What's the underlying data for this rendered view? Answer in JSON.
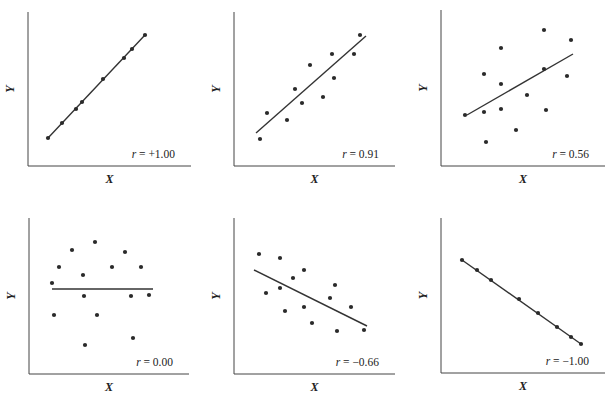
{
  "figure": {
    "panels_layout": "2 rows x 3 columns"
  },
  "chart_data": [
    {
      "type": "scatter",
      "title": "",
      "xlabel": "X",
      "ylabel": "Y",
      "annotation": "r = +1.00",
      "r_symbol": "r",
      "r_value": "= +1.00",
      "grid": false,
      "has_fit_line": true,
      "points_px": [
        [
          48,
          138
        ],
        [
          62,
          123
        ],
        [
          76,
          109
        ],
        [
          82,
          102
        ],
        [
          103,
          79
        ],
        [
          124,
          58
        ],
        [
          132,
          49
        ],
        [
          145,
          35
        ]
      ],
      "fit_px": [
        [
          48,
          138
        ],
        [
          145,
          35
        ]
      ],
      "axis_px": {
        "x0": 28,
        "y_top": 12,
        "y0": 166,
        "x_end": 191
      }
    },
    {
      "type": "scatter",
      "xlabel": "X",
      "ylabel": "Y",
      "annotation": "r = 0.91",
      "r_symbol": "r",
      "r_value": "= 0.91",
      "grid": false,
      "has_fit_line": true,
      "points_px": [
        [
          260,
          139
        ],
        [
          267,
          113
        ],
        [
          287,
          120
        ],
        [
          295,
          89
        ],
        [
          302,
          103
        ],
        [
          310,
          65
        ],
        [
          323,
          97
        ],
        [
          332,
          54
        ],
        [
          334,
          78
        ],
        [
          354,
          54
        ],
        [
          360,
          35
        ]
      ],
      "fit_px": [
        [
          256,
          133
        ],
        [
          366,
          36
        ]
      ],
      "axis_px": {
        "x0": 234,
        "y_top": 12,
        "y0": 166,
        "x_end": 395
      }
    },
    {
      "type": "scatter",
      "xlabel": "X",
      "ylabel": "Y",
      "annotation": "r = 0.56",
      "r_symbol": "r",
      "r_value": "= 0.56",
      "grid": false,
      "has_fit_line": true,
      "points_px": [
        [
          465,
          115
        ],
        [
          484,
          74
        ],
        [
          484,
          112
        ],
        [
          486,
          142
        ],
        [
          501,
          48
        ],
        [
          501,
          84
        ],
        [
          501,
          109
        ],
        [
          516,
          130
        ],
        [
          527,
          95
        ],
        [
          544,
          30
        ],
        [
          544,
          69
        ],
        [
          546,
          110
        ],
        [
          567,
          76
        ],
        [
          571,
          40
        ]
      ],
      "fit_px": [
        [
          467,
          115
        ],
        [
          573,
          54
        ]
      ],
      "axis_px": {
        "x0": 441,
        "y_top": 10,
        "y0": 166,
        "x_end": 605
      }
    },
    {
      "type": "scatter",
      "xlabel": "X",
      "ylabel": "Y",
      "annotation": "r = 0.00",
      "r_symbol": "r",
      "r_value": "= 0.00",
      "grid": false,
      "has_fit_line": true,
      "points_px": [
        [
          52,
          283
        ],
        [
          54,
          315
        ],
        [
          59,
          267
        ],
        [
          72,
          250
        ],
        [
          83,
          275
        ],
        [
          84,
          296
        ],
        [
          85,
          345
        ],
        [
          95,
          242
        ],
        [
          97,
          315
        ],
        [
          112,
          267
        ],
        [
          125,
          252
        ],
        [
          131,
          296
        ],
        [
          133,
          338
        ],
        [
          141,
          267
        ],
        [
          149,
          295
        ]
      ],
      "fit_px": [
        [
          52,
          289
        ],
        [
          153,
          289
        ]
      ],
      "axis_px": {
        "x0": 29,
        "y_top": 218,
        "y0": 374,
        "x_end": 189
      }
    },
    {
      "type": "scatter",
      "xlabel": "X",
      "ylabel": "Y",
      "annotation": "r = −0.66",
      "r_symbol": "r",
      "r_value": "= −0.66",
      "grid": false,
      "has_fit_line": true,
      "points_px": [
        [
          259,
          254
        ],
        [
          266,
          293
        ],
        [
          280,
          258
        ],
        [
          280,
          288
        ],
        [
          285,
          311
        ],
        [
          293,
          278
        ],
        [
          304,
          270
        ],
        [
          304,
          307
        ],
        [
          312,
          323
        ],
        [
          330,
          298
        ],
        [
          335,
          285
        ],
        [
          337,
          331
        ],
        [
          351,
          307
        ],
        [
          364,
          330
        ]
      ],
      "fit_px": [
        [
          254,
          270
        ],
        [
          367,
          326
        ]
      ],
      "axis_px": {
        "x0": 234,
        "y_top": 218,
        "y0": 374,
        "x_end": 395
      }
    },
    {
      "type": "scatter",
      "xlabel": "X",
      "ylabel": "Y",
      "annotation": "r = −1.00",
      "r_symbol": "r",
      "r_value": "= −1.00",
      "grid": false,
      "has_fit_line": true,
      "points_px": [
        [
          462,
          260
        ],
        [
          477,
          270
        ],
        [
          491,
          280
        ],
        [
          519,
          299
        ],
        [
          538,
          313
        ],
        [
          557,
          327
        ],
        [
          571,
          337
        ],
        [
          581,
          344
        ]
      ],
      "fit_px": [
        [
          462,
          260
        ],
        [
          581,
          344
        ]
      ],
      "axis_px": {
        "x0": 441,
        "y_top": 218,
        "y0": 373,
        "x_end": 605
      }
    }
  ],
  "style": {
    "ink": "#2a2a2a",
    "axis": "#444444",
    "background": "#ffffff"
  }
}
